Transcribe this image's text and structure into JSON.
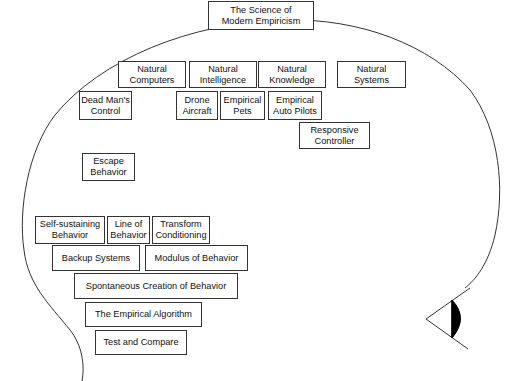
{
  "diagram": {
    "colors": {
      "stroke": "#333333",
      "text": "#111111",
      "background": "#ffffff",
      "pupil": "#000000"
    },
    "title": {
      "label": "The Science of\nModern Empiricism"
    },
    "row1": [
      {
        "label": "Natural\nComputers"
      },
      {
        "label": "Natural\nIntelligence"
      },
      {
        "label": "Natural\nKnowledge"
      },
      {
        "label": "Natural\nSystems"
      }
    ],
    "row2": [
      {
        "label": "Dead Man's\nControl"
      },
      {
        "label": "Drone\nAircraft"
      },
      {
        "label": "Empirical\nPets"
      },
      {
        "label": "Empirical\nAuto Pilots"
      }
    ],
    "responsive": {
      "label": "Responsive\nController"
    },
    "escape": {
      "label": "Escape\nBehavior"
    },
    "row3": [
      {
        "label": "Self-sustaining\nBehavior"
      },
      {
        "label": "Line of\nBehavior"
      },
      {
        "label": "Transform\nConditioning"
      }
    ],
    "row4": [
      {
        "label": "Backup Systems"
      },
      {
        "label": "Modulus of Behavior"
      }
    ],
    "spontaneous": {
      "label": "Spontaneous Creation of Behavior"
    },
    "algorithm": {
      "label": "The Empirical Algorithm"
    },
    "test": {
      "label": "Test and Compare"
    },
    "icons": {
      "head": "head-outline-icon",
      "eye": "eye-icon"
    }
  }
}
